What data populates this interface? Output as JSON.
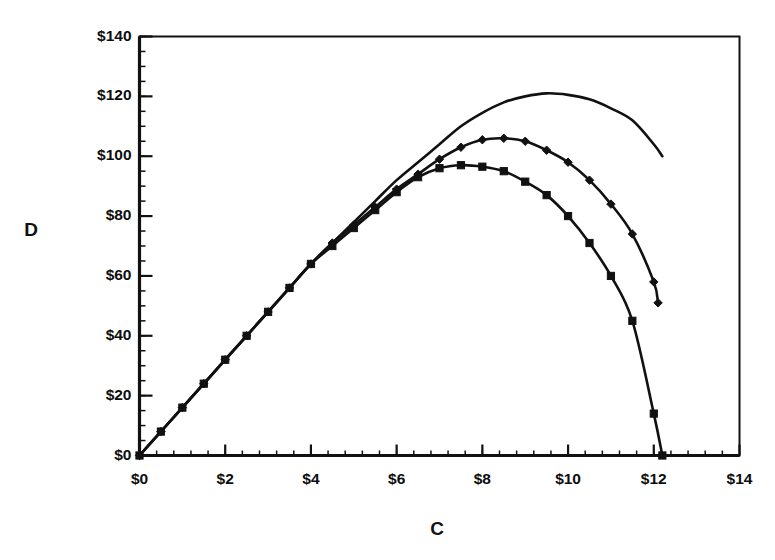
{
  "chart_data": {
    "type": "line",
    "title": "",
    "subtitle": "",
    "xlabel": "C",
    "ylabel": "D",
    "xlim": [
      0,
      14
    ],
    "ylim": [
      0,
      140
    ],
    "grid": false,
    "legend": "none",
    "x_tick_labels": [
      "$0",
      "$2",
      "$4",
      "$6",
      "$8",
      "$10",
      "$12",
      "$14"
    ],
    "x_tick_values": [
      0,
      2,
      4,
      6,
      8,
      10,
      12,
      14
    ],
    "y_tick_labels": [
      "$0",
      "$20",
      "$40",
      "$60",
      "$80",
      "$100",
      "$120",
      "$140"
    ],
    "y_tick_values": [
      0,
      20,
      40,
      60,
      80,
      100,
      120,
      140
    ],
    "x_minor_step": 0.4,
    "y_minor_step": 5,
    "annotations": [],
    "series": [
      {
        "name": "upper-curve",
        "marker": "none",
        "peak_x": 9.4,
        "peak_y": 121,
        "x": [
          0,
          0.5,
          1,
          1.5,
          2,
          2.5,
          3,
          3.5,
          4,
          4.5,
          5,
          5.5,
          6,
          6.5,
          7,
          7.5,
          8,
          8.5,
          9,
          9.5,
          10,
          10.5,
          11,
          11.5,
          12,
          12.2
        ],
        "y": [
          0,
          8,
          16,
          24,
          32,
          40,
          48,
          56,
          64,
          71,
          78,
          85,
          92,
          98,
          104,
          110,
          114.5,
          118,
          120,
          121,
          120.5,
          119,
          116,
          112,
          104,
          100
        ]
      },
      {
        "name": "middle-curve",
        "marker": "diamond",
        "peak_x": 8.3,
        "peak_y": 106,
        "x": [
          0,
          0.5,
          1,
          1.5,
          2,
          2.5,
          3,
          3.5,
          4,
          4.5,
          5,
          5.5,
          6,
          6.5,
          7,
          7.5,
          8,
          8.5,
          9,
          9.5,
          10,
          10.5,
          11,
          11.5,
          12,
          12.1
        ],
        "y": [
          0,
          8,
          16,
          24,
          32,
          40,
          48,
          56,
          64,
          71,
          77,
          83,
          89,
          94,
          99,
          103,
          105.5,
          106,
          105,
          102,
          98,
          92,
          84,
          74,
          58,
          51
        ]
      },
      {
        "name": "lower-curve",
        "marker": "square",
        "peak_x": 7.5,
        "peak_y": 97,
        "x": [
          0,
          0.5,
          1,
          1.5,
          2,
          2.5,
          3,
          3.5,
          4,
          4.5,
          5,
          5.5,
          6,
          6.5,
          7,
          7.5,
          8,
          8.5,
          9,
          9.5,
          10,
          10.5,
          11,
          11.5,
          12,
          12.2
        ],
        "y": [
          0,
          8,
          16,
          24,
          32,
          40,
          48,
          56,
          64,
          70,
          76,
          82,
          88,
          93,
          96,
          97,
          96.5,
          95,
          91.5,
          87,
          80,
          71,
          60,
          45,
          14,
          0
        ]
      }
    ]
  },
  "axes": {
    "x_title": "C",
    "y_title": "D"
  },
  "colors": {
    "ink": "#111111",
    "background": "#ffffff"
  }
}
